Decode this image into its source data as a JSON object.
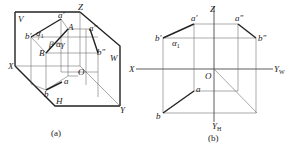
{
  "figure_a": {
    "caption": "(a)",
    "labels": {
      "V": "V",
      "Z": "Z",
      "X": "X",
      "W": "W",
      "H": "H",
      "Y": "Y",
      "O": "O",
      "a_prime": "a′",
      "A": "A",
      "B_top": "B",
      "B": "B",
      "b_prime": "b′",
      "a2": "a″",
      "b2": "b″",
      "a": "a",
      "b": "b",
      "alpha1": "α",
      "alpha1_sub": "1",
      "beta": "β",
      "gamma": "γ",
      "alpha": "α"
    }
  },
  "figure_b": {
    "caption": "(b)",
    "labels": {
      "Z": "Z",
      "X": "X",
      "O": "O",
      "Y_W": "Y",
      "Y_W_sub": "W",
      "Y_H": "Y",
      "Y_H_sub": "H",
      "a_prime": "a′",
      "b_prime": "b′",
      "a2": "a″",
      "b2": "b″",
      "a": "a",
      "b": "b",
      "alpha1": "α",
      "alpha1_sub": "1"
    }
  }
}
